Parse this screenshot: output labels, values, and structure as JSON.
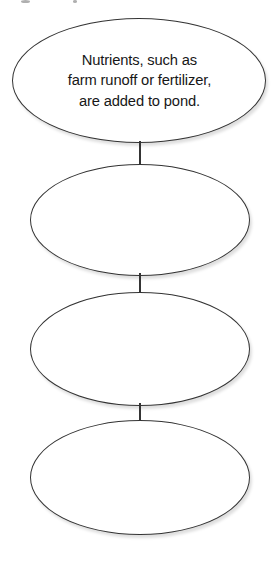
{
  "diagram": {
    "type": "vertical-flow-chart",
    "orientation": "top-to-bottom",
    "shape": "ellipse",
    "stroke_color": "#343434",
    "fill_color": "#ffffff",
    "text_color": "#171717",
    "connector_color": "#343434",
    "background_color": "#ffffff",
    "node_count": 4,
    "connector_count": 3,
    "nodes": [
      {
        "id": "node-1",
        "index": 1,
        "text": "Nutrients, such as\nfarm runoff or fertilizer,\nare added to pond.",
        "lines": [
          "Nutrients, such as",
          "farm runoff or fertilizer,",
          "are added to pond."
        ],
        "filled": true
      },
      {
        "id": "node-2",
        "index": 2,
        "text": "",
        "lines": [],
        "filled": false
      },
      {
        "id": "node-3",
        "index": 3,
        "text": "",
        "lines": [],
        "filled": false
      },
      {
        "id": "node-4",
        "index": 4,
        "text": "",
        "lines": [],
        "filled": false
      }
    ]
  }
}
